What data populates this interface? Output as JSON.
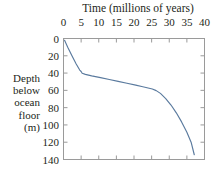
{
  "chart_data": {
    "type": "line",
    "title": "Time (millions of years)",
    "xlabel": "Time (millions of years)",
    "ylabel": "Depth below ocean floor (m)",
    "ylabel_lines": [
      "Depth",
      "below",
      "ocean",
      "floor",
      "(m)"
    ],
    "xlim": [
      0,
      40
    ],
    "ylim": [
      0,
      140
    ],
    "y_inverted": true,
    "x_axis_position": "top",
    "grid": false,
    "legend": null,
    "xticks": [
      0,
      5,
      10,
      15,
      20,
      25,
      30,
      35,
      40
    ],
    "xticklabels": [
      "0",
      "5",
      "10",
      "15",
      "20",
      "25",
      "30",
      "35",
      "40"
    ],
    "yticks": [
      0,
      20,
      40,
      60,
      80,
      100,
      120,
      140
    ],
    "yticklabels": [
      "0",
      "20",
      "40",
      "60",
      "80",
      "100",
      "120",
      "140"
    ],
    "series": [
      {
        "name": "sediment accumulation",
        "color": "#5a7a9e",
        "x": [
          0.3,
          1.2,
          2.4,
          3.6,
          4.6,
          5.0,
          5.3,
          6.2,
          8.0,
          10.5,
          13.0,
          15.5,
          18.0,
          20.5,
          22.5,
          24.0,
          25.2,
          26.3,
          27.5,
          29.0,
          30.5,
          32.0,
          33.5,
          35.0,
          36.2,
          37.1
        ],
        "y": [
          2.0,
          10.0,
          20.0,
          29.5,
          36.5,
          38.2,
          40.2,
          41.5,
          43.2,
          45.3,
          47.5,
          49.6,
          51.8,
          54.0,
          55.9,
          57.2,
          58.4,
          60.3,
          63.5,
          69.5,
          77.0,
          86.0,
          96.5,
          108.5,
          120.0,
          134.5
        ]
      }
    ]
  },
  "style": {
    "line_color": "#5a7a9e",
    "axis_color": "#9a9a9a",
    "text_color": "#231f20",
    "background": "#ffffff"
  }
}
